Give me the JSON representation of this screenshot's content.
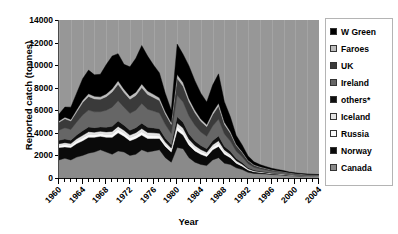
{
  "chart_data": {
    "type": "area",
    "stacked": true,
    "title": "",
    "xlabel": "Year",
    "ylabel": "Reported catch (tonnes)",
    "xlim": [
      1960,
      2004
    ],
    "ylim": [
      0,
      14000
    ],
    "ytick_labels": [
      "0",
      "2000",
      "4000",
      "6000",
      "8000",
      "10000",
      "12000",
      "14000"
    ],
    "ytick_values": [
      0,
      2000,
      4000,
      6000,
      8000,
      10000,
      12000,
      14000
    ],
    "xtick_labels": [
      "1960",
      "1964",
      "1968",
      "1972",
      "1976",
      "1980",
      "1984",
      "1988",
      "1992",
      "1996",
      "2000",
      "2004"
    ],
    "xtick_values": [
      1960,
      1964,
      1968,
      1972,
      1976,
      1980,
      1984,
      1988,
      1992,
      1996,
      2000,
      2004
    ],
    "grid": "vertical-faint",
    "legend_position": "right",
    "plot_background": "#979797",
    "x": [
      1960,
      1961,
      1962,
      1963,
      1964,
      1965,
      1966,
      1967,
      1968,
      1969,
      1970,
      1971,
      1972,
      1973,
      1974,
      1975,
      1976,
      1977,
      1978,
      1979,
      1980,
      1981,
      1982,
      1983,
      1984,
      1985,
      1986,
      1987,
      1988,
      1989,
      1990,
      1991,
      1992,
      1993,
      1994,
      1995,
      1996,
      1997,
      1998,
      1999,
      2000,
      2001,
      2002,
      2003,
      2004
    ],
    "stack_order_bottom_to_top": [
      "Canada",
      "Norway",
      "Russia",
      "Iceland",
      "others*",
      "Ireland",
      "UK",
      "Faroes",
      "W Green"
    ],
    "series": [
      {
        "name": "Canada",
        "color": "#8a8a8a",
        "values": [
          1600,
          1750,
          1600,
          1850,
          2000,
          2200,
          2300,
          2500,
          2300,
          2100,
          2400,
          2300,
          2000,
          2100,
          2500,
          2300,
          2400,
          2500,
          1800,
          1400,
          2700,
          2600,
          1800,
          1400,
          1200,
          1100,
          1600,
          1800,
          1300,
          1200,
          900,
          750,
          500,
          400,
          380,
          350,
          300,
          280,
          250,
          200,
          180,
          160,
          150,
          140,
          130
        ]
      },
      {
        "name": "Norway",
        "color": "#0a0a0a",
        "values": [
          1100,
          1000,
          1100,
          1200,
          1300,
          1400,
          1300,
          1200,
          1300,
          1500,
          1600,
          1400,
          1300,
          1400,
          1300,
          1200,
          1100,
          1000,
          1000,
          900,
          1500,
          1200,
          1100,
          1000,
          900,
          800,
          900,
          1000,
          800,
          600,
          400,
          300,
          200,
          150,
          120,
          100,
          90,
          80,
          70,
          60,
          50,
          45,
          40,
          38,
          35
        ]
      },
      {
        "name": "Russia",
        "color": "#fafafa",
        "values": [
          180,
          200,
          180,
          220,
          250,
          260,
          240,
          230,
          250,
          280,
          300,
          280,
          260,
          270,
          300,
          280,
          260,
          240,
          200,
          180,
          350,
          320,
          280,
          250,
          220,
          200,
          230,
          260,
          200,
          160,
          120,
          90,
          60,
          40,
          30,
          25,
          20,
          18,
          15,
          12,
          10,
          9,
          8,
          7,
          6
        ]
      },
      {
        "name": "Iceland",
        "color": "#e4e4e4",
        "values": [
          160,
          180,
          170,
          200,
          230,
          240,
          220,
          210,
          230,
          250,
          270,
          250,
          240,
          250,
          280,
          260,
          240,
          220,
          190,
          170,
          320,
          300,
          260,
          230,
          200,
          180,
          210,
          240,
          180,
          150,
          110,
          85,
          55,
          38,
          28,
          23,
          19,
          16,
          14,
          11,
          9,
          8,
          7,
          6,
          5
        ]
      },
      {
        "name": "others*",
        "color": "#101010",
        "values": [
          300,
          320,
          300,
          350,
          400,
          420,
          400,
          380,
          420,
          450,
          480,
          450,
          430,
          440,
          480,
          460,
          430,
          400,
          340,
          300,
          560,
          520,
          460,
          400,
          350,
          320,
          370,
          420,
          320,
          260,
          190,
          150,
          100,
          70,
          55,
          45,
          38,
          32,
          28,
          22,
          18,
          16,
          14,
          12,
          10
        ]
      },
      {
        "name": "Ireland",
        "color": "#666666",
        "values": [
          900,
          1000,
          950,
          1150,
          1400,
          1500,
          1400,
          1350,
          1500,
          1700,
          1800,
          1600,
          1500,
          1550,
          1750,
          1600,
          1500,
          1400,
          1200,
          1000,
          1900,
          1800,
          1600,
          1400,
          1200,
          1100,
          1300,
          1500,
          1100,
          900,
          650,
          500,
          350,
          250,
          200,
          170,
          140,
          120,
          100,
          85,
          70,
          60,
          55,
          50,
          45
        ]
      },
      {
        "name": "UK",
        "color": "#3a3a3a",
        "values": [
          700,
          800,
          750,
          900,
          1100,
          1200,
          1150,
          1100,
          1200,
          1350,
          1450,
          1300,
          1250,
          1300,
          1400,
          1300,
          1200,
          1100,
          950,
          800,
          1500,
          1400,
          1250,
          1100,
          950,
          850,
          1000,
          1150,
          850,
          700,
          500,
          380,
          260,
          190,
          150,
          125,
          105,
          90,
          75,
          62,
          52,
          45,
          40,
          36,
          32
        ]
      },
      {
        "name": "Faroes",
        "color": "#bdbdbd",
        "values": [
          120,
          140,
          130,
          170,
          220,
          240,
          230,
          220,
          250,
          280,
          320,
          290,
          270,
          290,
          330,
          300,
          280,
          250,
          200,
          160,
          340,
          320,
          280,
          240,
          200,
          180,
          220,
          260,
          190,
          150,
          100,
          75,
          50,
          35,
          28,
          22,
          18,
          15,
          12,
          10,
          8,
          7,
          6,
          5,
          4
        ]
      },
      {
        "name": "W Green",
        "color": "#000000",
        "values": [
          600,
          900,
          1100,
          1500,
          1900,
          2100,
          1900,
          2000,
          2600,
          2900,
          2400,
          2200,
          2600,
          3000,
          3400,
          3100,
          2600,
          2200,
          1600,
          1100,
          2700,
          2500,
          2900,
          2600,
          2300,
          2000,
          2400,
          2600,
          1800,
          1300,
          800,
          600,
          380,
          260,
          200,
          160,
          130,
          110,
          90,
          75,
          60,
          50,
          45,
          40,
          35
        ]
      }
    ]
  },
  "axes": {
    "y_title": "Reported catch (tonnes)",
    "x_title": "Year"
  },
  "legend": {
    "items": [
      {
        "label": "W Green",
        "color": "#000000"
      },
      {
        "label": "Faroes",
        "color": "#bdbdbd"
      },
      {
        "label": "UK",
        "color": "#3a3a3a"
      },
      {
        "label": "Ireland",
        "color": "#666666"
      },
      {
        "label": "others*",
        "color": "#101010"
      },
      {
        "label": "Iceland",
        "color": "#e4e4e4"
      },
      {
        "label": "Russia",
        "color": "#fafafa"
      },
      {
        "label": "Norway",
        "color": "#0a0a0a"
      },
      {
        "label": "Canada",
        "color": "#8a8a8a"
      }
    ]
  }
}
